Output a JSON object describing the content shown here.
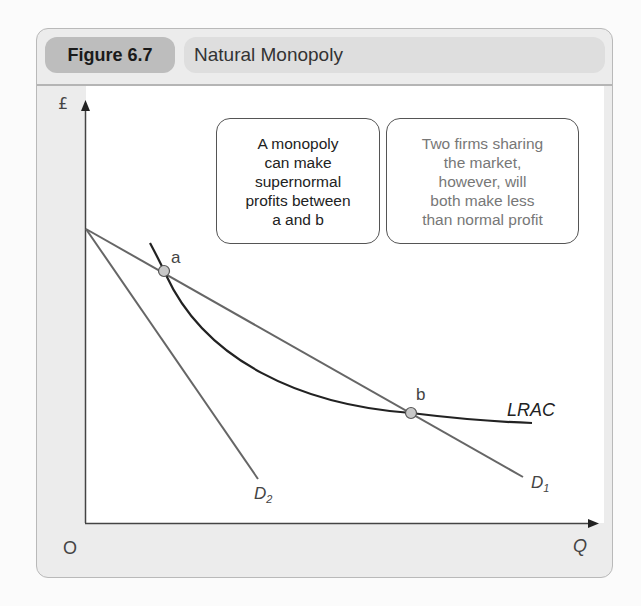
{
  "header": {
    "figure_label": "Figure 6.7",
    "title": "Natural Monopoly"
  },
  "axes": {
    "y_label": "£",
    "x_label": "Q",
    "origin_label": "O"
  },
  "annotations": {
    "box1": [
      "A monopoly",
      "can make",
      "supernormal",
      "profits between",
      "a and b"
    ],
    "box2": [
      "Two firms sharing",
      "the market,",
      "however, will",
      "both make less",
      "than normal profit"
    ]
  },
  "curves": {
    "lrac": "LRAC",
    "d1": "D",
    "d1_sub": "1",
    "d2": "D",
    "d2_sub": "2"
  },
  "points": {
    "a": "a",
    "b": "b"
  },
  "colors": {
    "figure_pill": "#bdbdbd",
    "title_pill": "#dedede",
    "frame_bg": "#ececec",
    "curve": "#222222",
    "demand": "#666666",
    "point_fill": "#c8c8c8"
  }
}
